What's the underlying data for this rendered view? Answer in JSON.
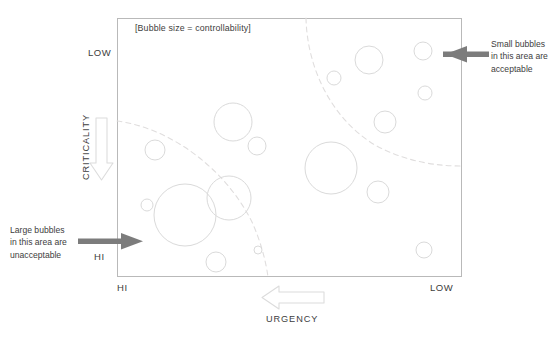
{
  "figure": {
    "legend_note": "[Bubble size = controllability]",
    "axes": {
      "y": {
        "title": "CRITICALITY",
        "top_label": "LOW",
        "bottom_label": "HI",
        "direction_icon": "down-arrow-icon"
      },
      "x": {
        "title": "URGENCY",
        "left_label": "HI",
        "right_label": "LOW",
        "direction_icon": "left-arrow-icon"
      }
    },
    "annotations": [
      {
        "id": "left-annotation",
        "text": "Large bubbles\nin this area are\nunacceptable",
        "arrow": "right-arrow-icon",
        "arrow_color": "#7c7c7c"
      },
      {
        "id": "right-annotation",
        "text": "Small bubbles\nin this area are\nacceptable",
        "arrow": "left-arrow-icon",
        "arrow_color": "#7c7c7c"
      }
    ],
    "colors": {
      "frame": "#b9b9b9",
      "bubble_stroke": "#dadada",
      "divider_dashed": "#e0dede",
      "arrow_solid": "#7c7c7c",
      "arrow_hollow_stroke": "#dcdcdc",
      "text": "#3d3d3d"
    }
  },
  "chart_data": {
    "type": "scatter",
    "title": "",
    "subtitle": "[Bubble size = controllability]",
    "xlabel": "URGENCY",
    "ylabel": "CRITICALITY",
    "xlim": [
      0,
      100
    ],
    "ylim": [
      0,
      100
    ],
    "x_tick_labels": [
      "HI",
      "LOW"
    ],
    "y_tick_labels": [
      "LOW",
      "HI"
    ],
    "x_axis_direction": "HI (left) to LOW (right)",
    "y_axis_direction": "LOW (top) to HI (bottom)",
    "grid": false,
    "legend": "none",
    "size_encoding": "controllability",
    "note": "Bubble radius encodes controllability; x is urgency decreasing rightward, y is criticality increasing downward.",
    "points": [
      {
        "cx": 233,
        "cy": 122,
        "r": 19
      },
      {
        "cx": 155,
        "cy": 150,
        "r": 10
      },
      {
        "cx": 257,
        "cy": 146,
        "r": 9
      },
      {
        "cx": 147,
        "cy": 205,
        "r": 6
      },
      {
        "cx": 185,
        "cy": 215,
        "r": 31
      },
      {
        "cx": 229,
        "cy": 198,
        "r": 22
      },
      {
        "cx": 216,
        "cy": 262,
        "r": 10
      },
      {
        "cx": 258,
        "cy": 250,
        "r": 4
      },
      {
        "cx": 331,
        "cy": 168,
        "r": 26
      },
      {
        "cx": 369,
        "cy": 60,
        "r": 14
      },
      {
        "cx": 334,
        "cy": 78,
        "r": 7
      },
      {
        "cx": 385,
        "cy": 122,
        "r": 11
      },
      {
        "cx": 423,
        "cy": 51,
        "r": 9
      },
      {
        "cx": 425,
        "cy": 93,
        "r": 7
      },
      {
        "cx": 378,
        "cy": 192,
        "r": 11
      },
      {
        "cx": 424,
        "cy": 250,
        "r": 8
      }
    ],
    "dividers": [
      {
        "id": "lower-left-threshold",
        "kind": "dashed-arc"
      },
      {
        "id": "upper-right-threshold",
        "kind": "dashed-arc"
      }
    ]
  }
}
